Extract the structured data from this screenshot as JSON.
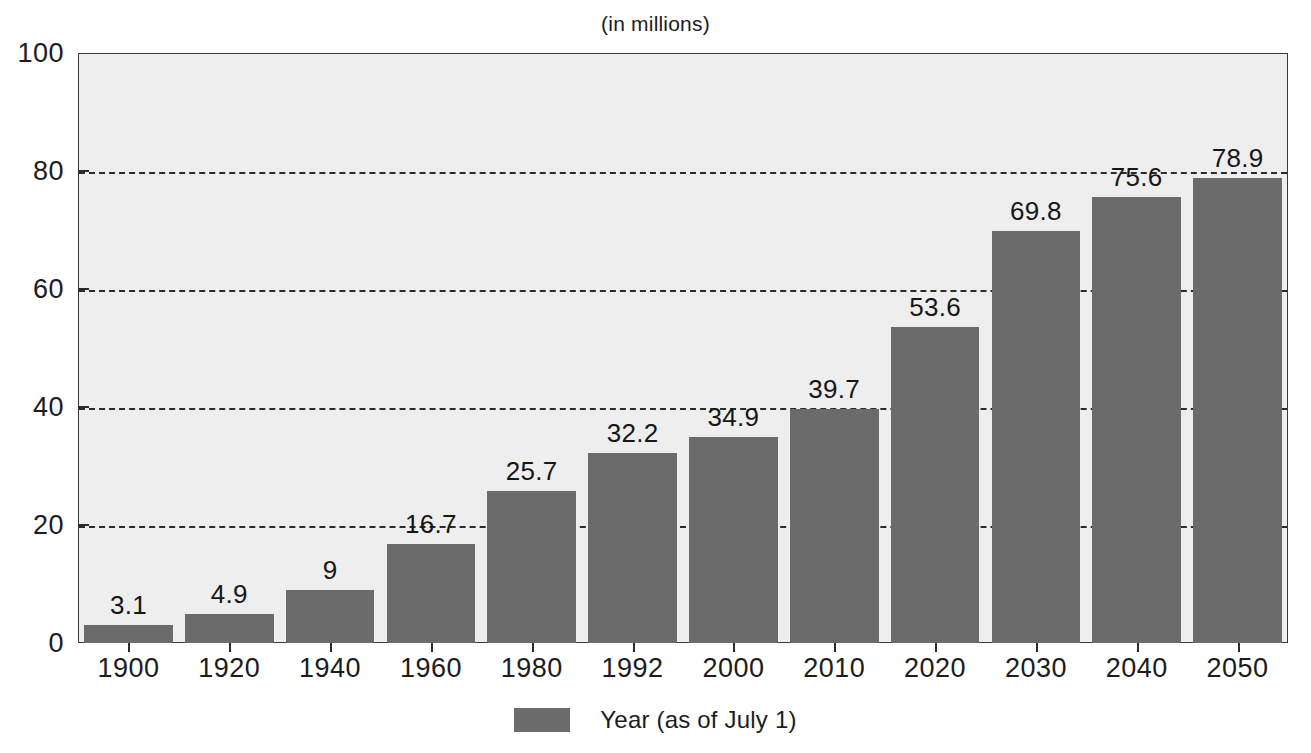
{
  "chart_data": {
    "type": "bar",
    "title": "(in millions)",
    "xlabel": "",
    "ylabel": "",
    "categories": [
      "1900",
      "1920",
      "1940",
      "1960",
      "1980",
      "1992",
      "2000",
      "2010",
      "2020",
      "2030",
      "2040",
      "2050"
    ],
    "values": [
      3.1,
      4.9,
      9,
      16.7,
      25.7,
      32.2,
      34.9,
      39.7,
      53.6,
      69.8,
      75.6,
      78.9
    ],
    "value_labels": [
      "3.1",
      "4.9",
      "9",
      "16.7",
      "25.7",
      "32.2",
      "34.9",
      "39.7",
      "53.6",
      "69.8",
      "75.6",
      "78.9"
    ],
    "ylim": [
      0,
      100
    ],
    "y_ticks": [
      0,
      20,
      40,
      60,
      80,
      100
    ],
    "y_tick_labels": [
      "0",
      "20",
      "40",
      "60",
      "80",
      "100"
    ],
    "gridlines_at": [
      20,
      40,
      60,
      80
    ],
    "grid": true,
    "grid_style": "dashed",
    "legend": {
      "position": "bottom-center",
      "entries": [
        {
          "label": "Year (as of July 1)",
          "color": "#6b6b6b"
        }
      ]
    },
    "colors": {
      "bar_fill": "#6b6b6b",
      "plot_background": "#eeeeee",
      "frame": "#3a3a3a",
      "gridline": "#2b2b2b",
      "text": "#1c1c1c",
      "page_background": "#ffffff"
    }
  }
}
